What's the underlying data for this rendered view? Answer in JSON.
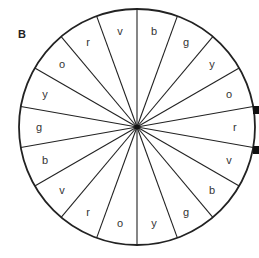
{
  "panel_label": "B",
  "wheel": {
    "center": [
      137,
      127
    ],
    "radius": 118,
    "sector_count": 18,
    "line_color": "#222222",
    "sectors_clockwise_from_top": [
      "b",
      "g",
      "y",
      "o",
      "r",
      "v",
      "b",
      "g",
      "y",
      "o",
      "r",
      "v",
      "b",
      "g",
      "y",
      "o",
      "r",
      "v"
    ]
  }
}
